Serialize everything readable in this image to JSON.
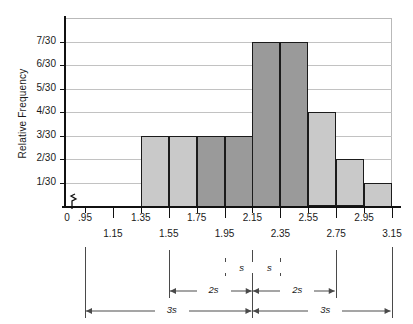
{
  "chart_data": {
    "type": "bar",
    "title": "",
    "xlabel": "",
    "ylabel": "Relative Frequency",
    "categories": [
      "1.35-1.55",
      "1.55-1.75",
      "1.75-1.95",
      "1.95-2.15",
      "2.15-2.35",
      "2.35-2.55",
      "2.55-2.75",
      "2.75-2.95",
      "2.95-3.15"
    ],
    "bin_edges": [
      1.35,
      1.55,
      1.75,
      1.95,
      2.15,
      2.35,
      2.55,
      2.75,
      2.95,
      3.15
    ],
    "values": [
      3,
      3,
      3,
      3,
      7,
      7,
      4,
      2,
      1
    ],
    "value_labels": [
      "3/30",
      "3/30",
      "3/30",
      "3/30",
      "7/30",
      "7/30",
      "4/30",
      "2/30",
      "1/30"
    ],
    "denominator": 30,
    "bar_shading": [
      "light",
      "light",
      "dark",
      "dark",
      "dark",
      "dark",
      "light",
      "light",
      "light"
    ],
    "ylim": [
      0,
      8
    ],
    "yticks": [
      "1/30",
      "2/30",
      "3/30",
      "4/30",
      "5/30",
      "6/30",
      "7/30"
    ],
    "ytick_values": [
      1,
      2,
      3,
      4,
      5,
      6,
      7
    ],
    "xticks_upper": [
      "0",
      ".95",
      "1.35",
      "1.75",
      "2.15",
      "2.55",
      "2.95"
    ],
    "xticks_upper_values": [
      0,
      0.95,
      1.35,
      1.75,
      2.15,
      2.55,
      2.95
    ],
    "xticks_lower": [
      "1.15",
      "1.55",
      "1.95",
      "2.35",
      "2.75",
      "3.15"
    ],
    "xticks_lower_values": [
      1.15,
      1.55,
      1.95,
      2.35,
      2.75,
      3.15
    ],
    "axis_break": true,
    "grid": true,
    "legend": "none",
    "colors": {
      "bar_light": "#c9c9c9",
      "bar_dark": "#9a9a9a",
      "bar_outline": "#1b1b1b",
      "gridline": "#c2c2c2",
      "axis": "#111111",
      "annotation": "#4a4a4a",
      "text": "#1a1a1a",
      "background": "#ffffff"
    },
    "annotations": [
      {
        "label": "s",
        "from": 1.95,
        "to": 2.15,
        "row": 0
      },
      {
        "label": "s",
        "from": 2.15,
        "to": 2.35,
        "row": 0
      },
      {
        "label": "2s",
        "from": 1.55,
        "to": 2.15,
        "row": 1
      },
      {
        "label": "2s",
        "from": 2.15,
        "to": 2.75,
        "row": 1
      },
      {
        "label": "3s",
        "from": 0.95,
        "to": 2.15,
        "row": 2
      },
      {
        "label": "3s",
        "from": 2.15,
        "to": 3.15,
        "row": 2
      }
    ],
    "annotation_center": 2.15,
    "annotation_tick_values": [
      0.95,
      1.55,
      1.95,
      2.15,
      2.35,
      2.75,
      3.15
    ]
  }
}
